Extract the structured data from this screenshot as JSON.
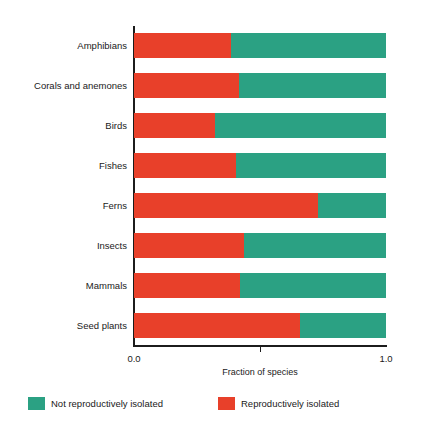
{
  "chart_data": {
    "type": "bar",
    "orientation": "horizontal",
    "stacked": true,
    "normalized": true,
    "title": "",
    "xlabel": "Fraction of species",
    "ylabel": "",
    "xlim": [
      0.0,
      1.0
    ],
    "xticks": [
      0.0,
      0.5,
      1.0
    ],
    "xticklabels": [
      "0.0",
      "",
      "1.0"
    ],
    "grid": false,
    "legend_position": "bottom",
    "categories": [
      "Amphibians",
      "Corals and anemones",
      "Birds",
      "Fishes",
      "Ferns",
      "Insects",
      "Mammals",
      "Seed plants"
    ],
    "series": [
      {
        "name": "Reproductively isolated",
        "color": "#e8402a",
        "values": [
          0.385,
          0.415,
          0.32,
          0.405,
          0.73,
          0.437,
          0.42,
          0.66
        ]
      },
      {
        "name": "Not reproductively isolated",
        "color": "#2ba183",
        "values": [
          0.615,
          0.585,
          0.68,
          0.595,
          0.27,
          0.563,
          0.58,
          0.34
        ]
      }
    ]
  },
  "axis": {
    "x_title": "Fraction of species",
    "tick_labels": [
      {
        "value": 0.0,
        "text": "0.0"
      },
      {
        "value": 0.5,
        "text": ""
      },
      {
        "value": 1.0,
        "text": "1.0"
      }
    ]
  },
  "legend": {
    "entries": [
      {
        "label": "Not reproductively isolated",
        "color": "#2ba183"
      },
      {
        "label": "Reproductively isolated",
        "color": "#e8402a"
      }
    ]
  },
  "colors": {
    "reproductively_isolated": "#e8402a",
    "not_reproductively_isolated": "#2ba183",
    "axis": "#1c1c1c",
    "text": "#1a1a1a",
    "background": "#ffffff"
  }
}
